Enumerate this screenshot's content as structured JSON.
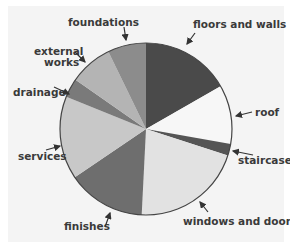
{
  "chart_data": {
    "type": "pie",
    "title": "",
    "start_angle_deg": 0,
    "direction": "clockwise",
    "slices": [
      {
        "label": "floors and walls",
        "value": 16.7,
        "color": "#4a4a4a"
      },
      {
        "label": "roof",
        "value": 11.1,
        "color": "#f7f7f7"
      },
      {
        "label": "staircase",
        "value": 2.2,
        "color": "#555555"
      },
      {
        "label": "windows and doors",
        "value": 20.8,
        "color": "#e2e2e2"
      },
      {
        "label": "finishes",
        "value": 14.7,
        "color": "#6e6e6e"
      },
      {
        "label": "services",
        "value": 15.6,
        "color": "#c8c8c8"
      },
      {
        "label": "drainage",
        "value": 3.6,
        "color": "#7a7a7a"
      },
      {
        "label": "external works",
        "value": 8.1,
        "color": "#b4b4b4"
      },
      {
        "label": "foundations",
        "value": 7.2,
        "color": "#8c8c8c"
      }
    ],
    "legend": "none (direct labels with arrows)"
  },
  "labels": {
    "floors_and_walls": "floors and walls",
    "roof": "roof",
    "staircase": "staircase",
    "windows_and_doors": "windows and doors",
    "finishes": "finishes",
    "services": "services",
    "drainage": "drainage",
    "external_works_line1": "external",
    "external_works_line2": "works",
    "foundations": "foundations"
  }
}
